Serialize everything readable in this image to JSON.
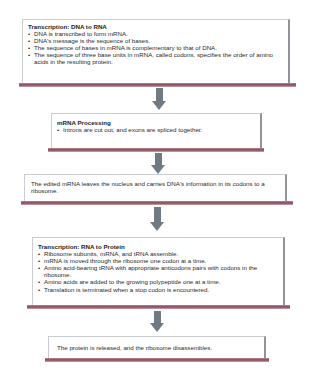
{
  "diagram": {
    "steps": [
      {
        "title": "Transcription: DNA to RNA",
        "bullets": [
          "DNA is transcribed to form mRNA.",
          "DNA's message is the sequence of bases.",
          "The sequence of bases in mRNA is complementary to that of DNA.",
          "The sequence of three base units in mRNA, called codons, specifies the order of amino acids in the resulting protein."
        ]
      },
      {
        "title": "mRNA Processing",
        "bullets": [
          "Introns are cut out, and exons are spliced together."
        ]
      },
      {
        "text": "The edited mRNA leaves the nucleus and carries DNA's information in its codons to a ribosome."
      },
      {
        "title": "Transcription: RNA to Protein",
        "bullets": [
          "Ribosome subunits, mRNA, and tRNA assemble.",
          "mRNA is moved through the ribosome one codon at a time.",
          "Amino acid-bearing tRNA with appropriate anticodons pairs with codons in the ribosome.",
          "Amino acids are added to the growing polypeptide one at a time.",
          "Translation is terminated when a stop codon is encountered."
        ]
      },
      {
        "text": "The protein is released, and the ribosome disassembles."
      }
    ],
    "arrows": [
      {
        "from": 0,
        "to": 1,
        "icon": "down-arrow-icon"
      },
      {
        "from": 1,
        "to": 2,
        "icon": "down-arrow-icon"
      },
      {
        "from": 2,
        "to": 3,
        "icon": "down-arrow-icon"
      },
      {
        "from": 3,
        "to": 4,
        "icon": "down-arrow-icon"
      }
    ],
    "colors": {
      "arrow": "#6f7a82",
      "bottom_bar": "#8a4a5a",
      "box_border": "#c9ccd0",
      "box_right_edge": "#8e9499"
    }
  }
}
